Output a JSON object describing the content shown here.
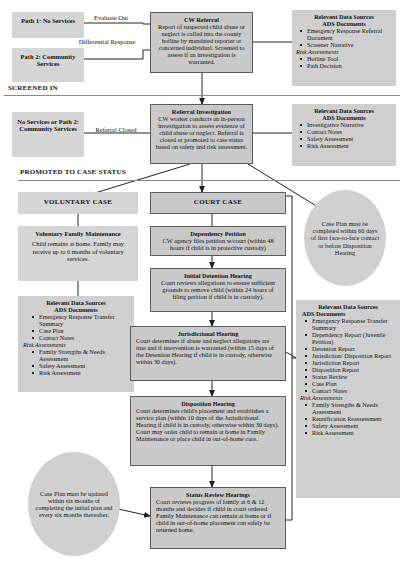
{
  "flow": {
    "title": "Child Welfare Case Flow",
    "dividers": [
      {
        "label": "SCREENED IN"
      },
      {
        "label": "PROMOTED TO CASE STATUS"
      }
    ],
    "nodes": {
      "path1": {
        "title": "Path 1: No Services",
        "body": ""
      },
      "path2": {
        "title": "Path 2: Community Services",
        "body": ""
      },
      "cw_referral": {
        "title": "CW Referral",
        "body": "Report of suspected child abuse or neglect is called into the county hotline by mandated reporter or concerned individual. Screened to assess if an investigation is warranted."
      },
      "no_service": {
        "title": "No Services or Path 2: Community Services",
        "body": ""
      },
      "referral_investigation": {
        "title": "Referral Investigation",
        "body": "CW worker conducts an in-person investigation to assess evidence of child abuse or neglect. Referral is closed or promoted to case status based on safety and risk assessment."
      },
      "voluntary_case": {
        "title": "VOLUNTARY CASE",
        "body": ""
      },
      "voluntary_family_maintenance": {
        "title": "Voluntary Family Maintenance",
        "body": "Child remains at home. Family may receive up to 6 months of voluntary services."
      },
      "court_case": {
        "title": "COURT CASE",
        "body": ""
      },
      "dependency_petition": {
        "title": "Dependency Petition",
        "body": "CW agency files petition w/court (within 48 hours if child is in protective custody)"
      },
      "initial_detention_hearing": {
        "title": "Initial Detention Hearing",
        "body": "Court reviews allegations to ensure sufficient grounds to remove child (within 24 hours of filing petition if child is in custody)."
      },
      "jurisdictional_hearing": {
        "title": "Jurisdictional Hearing",
        "body": "Court determines if abuse and neglect allegations are true and if intervention is warranted (within 15 days of the Detention Hearing if child is in custody, otherwise within 30 days)."
      },
      "disposition_hearing": {
        "title": "Disposition Hearing",
        "body": "Court determines child's placement and establishes a service plan (within 10 days of the Jurisdictional Hearing if child is in custody, otherwise within 30 days). Court may order child to remain at home in Family Maintenance or place child in out-of-home care."
      },
      "status_review_hearings": {
        "title": "Status Review Hearings",
        "body": "Court reviews progress of family at 6 & 12 months and decides if child in court ordered Family Maintenance can remain at home or if child in out-of-home placement can safely be returned home."
      }
    },
    "edge_labels": {
      "evaluate_out": "Evaluate Out",
      "differential_response": "Differential Response",
      "referral_closed": "Referral Closed"
    },
    "callouts": {
      "case_plan_completed": "Case Plan must be completed within 60 days of first face-to-face contact or before Disposition Hearing",
      "case_plan_updated": "Case Plan must be updated within six months of completing the initial plan and every six months thereafter."
    },
    "panels": {
      "referral": {
        "heading": "Relevant Data Sources",
        "subheading": "ADS Documents",
        "documents": [
          "Emergency Response Referral Document",
          "Screener Narrative"
        ],
        "risk_label": "Risk Assessments",
        "risk_items": [
          "Hotline Tool",
          "Path Decision"
        ]
      },
      "investigation": {
        "heading": "Relevant Data Sources",
        "subheading": "ADS Documents",
        "documents": [
          "Investigative Narrative",
          "Contact Notes",
          "Safety Assessment",
          "Risk Assessment"
        ],
        "risk_label": "",
        "risk_items": []
      },
      "voluntary": {
        "heading": "Relevant Data Sources",
        "subheading": "ADS Documents",
        "documents": [
          "Emergency Response Transfer Summary",
          "Case Plan",
          "Contact Notes"
        ],
        "risk_label": "Risk Assessments",
        "risk_items": [
          "Family Strengths & Needs Assessment",
          "Safety Assessment",
          "Risk Assessment"
        ]
      },
      "court": {
        "heading": "Relevant Data Sources",
        "subheading": "ADS Documents",
        "documents": [
          "Emergency Response Transfer Summary",
          "Dependency Report (Juvenile Petition)",
          "Detention Report",
          "Jurisdiction/ Disposition Report",
          "Jurisdiction Report",
          "Disposition Report",
          "Status Review",
          "Case Plan",
          "Contact Notes"
        ],
        "risk_label": "Risk Assessments",
        "risk_items": [
          "Family Strengths & Needs Assessment",
          "Reunification Reassessment",
          "Safety Assessment",
          "Risk Assessment"
        ]
      }
    },
    "colors": {
      "box_fill": "#c9c9c9",
      "panel_fill": "#cfcfcf",
      "flat_fill": "#d5d5d5",
      "border": "#5c5c5c",
      "text": "#111111"
    }
  }
}
